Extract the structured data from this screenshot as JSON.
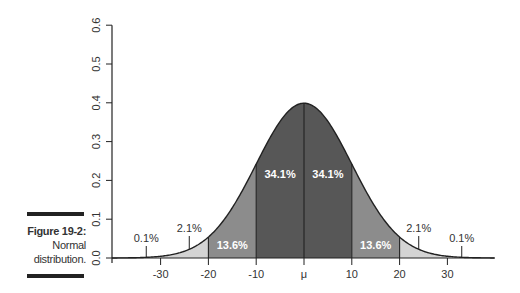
{
  "caption": {
    "figure_label": "Figure 19-2:",
    "line1": "Normal",
    "line2": "distribution."
  },
  "chart_data": {
    "type": "area",
    "title": "",
    "xlabel": "",
    "ylabel": "",
    "distribution": "normal",
    "mean_label": "μ",
    "sigma": 10,
    "xlim": [
      -40,
      40
    ],
    "ylim": [
      0,
      0.6
    ],
    "yticks": [
      0.0,
      0.1,
      0.2,
      0.3,
      0.4,
      0.5,
      0.6
    ],
    "ytick_labels": [
      "0.0",
      "0.1",
      "0.2",
      "0.3",
      "0.4",
      "0.5",
      "0.6"
    ],
    "xticks": [
      -30,
      -20,
      -10,
      0,
      10,
      20,
      30
    ],
    "xtick_labels": [
      "-30",
      "-20",
      "-10",
      "μ",
      "10",
      "20",
      "30"
    ],
    "grid": false,
    "regions": [
      {
        "from": -40,
        "to": -30,
        "percent": "0.1%",
        "shade": "white"
      },
      {
        "from": -30,
        "to": -20,
        "percent": "2.1%",
        "shade": "light"
      },
      {
        "from": -20,
        "to": -10,
        "percent": "13.6%",
        "shade": "medium"
      },
      {
        "from": -10,
        "to": 0,
        "percent": "34.1%",
        "shade": "dark"
      },
      {
        "from": 0,
        "to": 10,
        "percent": "34.1%",
        "shade": "dark"
      },
      {
        "from": 10,
        "to": 20,
        "percent": "13.6%",
        "shade": "medium"
      },
      {
        "from": 20,
        "to": 30,
        "percent": "2.1%",
        "shade": "light"
      },
      {
        "from": 30,
        "to": 40,
        "percent": "0.1%",
        "shade": "white"
      }
    ],
    "annotations": [
      {
        "text": "0.1%",
        "x": -33,
        "style": "callout"
      },
      {
        "text": "2.1%",
        "x": -24,
        "style": "callout"
      },
      {
        "text": "13.6%",
        "x": -15,
        "style": "inside"
      },
      {
        "text": "34.1%",
        "x": -5,
        "style": "inside"
      },
      {
        "text": "34.1%",
        "x": 5,
        "style": "inside"
      },
      {
        "text": "13.6%",
        "x": 15,
        "style": "inside"
      },
      {
        "text": "2.1%",
        "x": 24,
        "style": "callout"
      },
      {
        "text": "0.1%",
        "x": 33,
        "style": "callout"
      }
    ],
    "colors": {
      "light": "#d4d4d4",
      "medium": "#8c8c8c",
      "dark": "#575757",
      "line": "#222222",
      "inside_text": "#ffffff",
      "text": "#333333"
    }
  }
}
